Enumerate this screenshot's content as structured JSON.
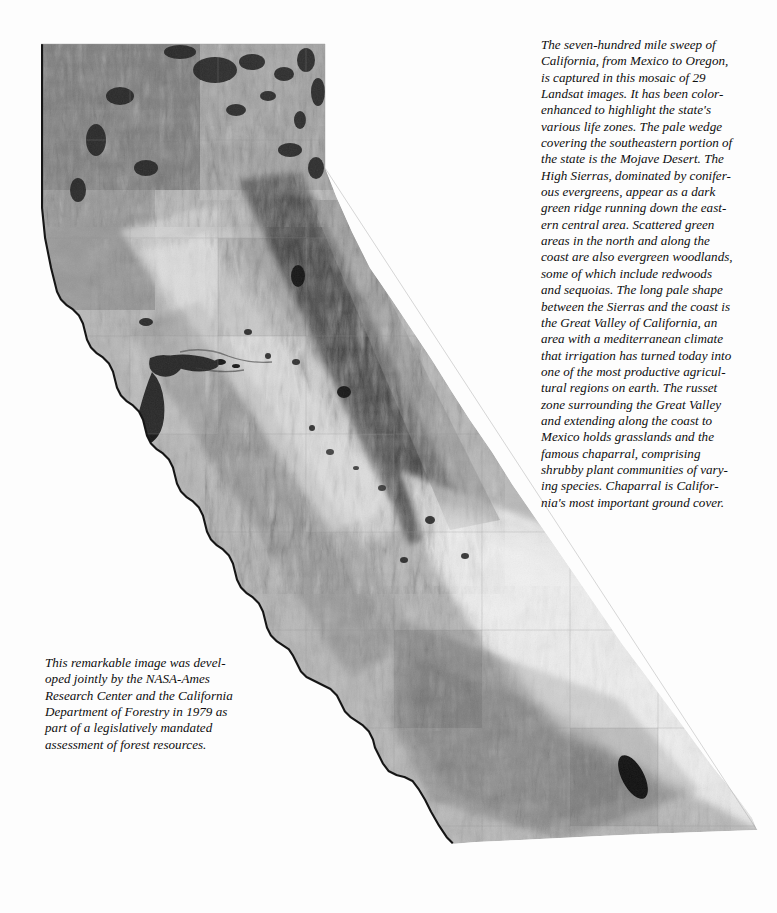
{
  "page": {
    "background_color": "#fdfdfd",
    "width": 777,
    "height": 913
  },
  "main_caption": {
    "name": "landsat-mosaic-description",
    "text": "The seven-hundred mile sweep of California, from Mexico to Oregon, is captured in this mosaic of 29 Landsat images. It has been color-enhanced to highlight the state's various life zones. The pale wedge covering the southeastern portion of the state is the Mojave Desert. The High Sierras, dominated by coniferous evergreens, appear as a dark green ridge running down the eastern central area. Scattered green areas in the north and along the coast are also evergreen woodlands, some of which include redwoods and sequoias. The long pale shape between the Sierras and the coast is the Great Valley of California, an area with a mediterranean climate that irrigation has turned today into one of the most productive agricultural regions on earth. The russet zone surrounding the Great Valley and extending along the coast to Mexico holds grasslands and the famous chaparral, comprising shrubby plant communities of varying species. Chaparral is California's most important ground cover.",
    "lines": [
      "The seven-hundred mile sweep of",
      "California, from Mexico to Oregon,",
      "is captured in this mosaic of 29",
      "Landsat images. It has been color-",
      "enhanced to highlight the state's",
      "various life zones. The pale wedge",
      "covering the southeastern portion of",
      "the state is the Mojave Desert. The",
      "High Sierras, dominated by conifer-",
      "ous evergreens, appear as a dark",
      "green ridge running down the east-",
      "ern central area. Scattered green",
      "areas in the north and along the",
      "coast are also evergreen woodlands,",
      "some of which include redwoods",
      "and sequoias. The long pale shape",
      "between the Sierras and the coast is",
      "the Great Valley of California, an",
      "area with a mediterranean climate",
      "that irrigation has turned today into",
      "one of the most productive agricul-",
      "tural regions on earth. The russet",
      "zone surrounding the Great Valley",
      "and extending along the coast to",
      "Mexico holds grasslands and the",
      "famous chaparral, comprising",
      "shrubby plant communities of vary-",
      "ing species. Chaparral is Califor-",
      "nia's most important ground cover."
    ]
  },
  "credit_caption": {
    "name": "development-credit",
    "text": "This remarkable image was developed jointly by the NASA-Ames Research Center and the California Department of Forestry in 1979 as part of a legislatively mandated assessment of forest resources.",
    "lines": [
      "This remarkable image was devel-",
      "oped jointly by the NASA-Ames",
      "Research Center and the California",
      "Department of Forestry in 1979 as",
      "part of a legislatively mandated",
      "assessment of forest resources."
    ]
  },
  "map": {
    "name": "california-landsat-mosaic",
    "subject": "State of California",
    "imagery": "Landsat satellite mosaic, 29 images",
    "rendering": "grayscale halftone print",
    "features": [
      {
        "name": "Mojave Desert",
        "tone": "pale",
        "region": "southeast"
      },
      {
        "name": "High Sierras",
        "tone": "dark",
        "region": "east-central ridge"
      },
      {
        "name": "Great Valley",
        "tone": "pale",
        "region": "central"
      },
      {
        "name": "Pacific Ocean",
        "tone": "white",
        "region": "west"
      },
      {
        "name": "San Francisco Bay",
        "tone": "dark",
        "region": "central coast"
      },
      {
        "name": "Salton Sea",
        "tone": "dark",
        "region": "southeast"
      },
      {
        "name": "Mono Lake",
        "tone": "dark",
        "region": "east"
      },
      {
        "name": "Lake Tahoe",
        "tone": "dark",
        "region": "east-central"
      },
      {
        "name": "Central Coast Ranges",
        "tone": "mid",
        "region": "west"
      },
      {
        "name": "Klamath Mountains",
        "tone": "dark",
        "region": "north"
      }
    ]
  }
}
